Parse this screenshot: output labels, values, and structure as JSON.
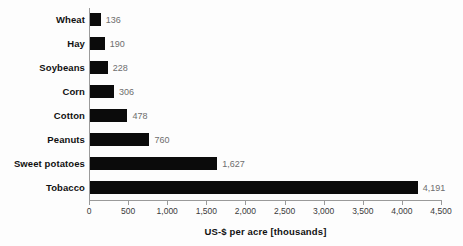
{
  "chart_data": {
    "type": "bar",
    "orientation": "horizontal",
    "title": "",
    "subtitle": "",
    "xlabel": "US-$ per acre [thousands]",
    "ylabel": "",
    "categories": [
      "Wheat",
      "Hay",
      "Soybeans",
      "Corn",
      "Cotton",
      "Peanuts",
      "Sweet potatoes",
      "Tobacco"
    ],
    "values": [
      136,
      190,
      228,
      306,
      478,
      760,
      1627,
      4191
    ],
    "value_labels": [
      "136",
      "190",
      "228",
      "306",
      "478",
      "760",
      "1,627",
      "4,191"
    ],
    "xlim": [
      0,
      4500
    ],
    "xticks": [
      0,
      500,
      1000,
      1500,
      2000,
      2500,
      3000,
      3500,
      4000,
      4500
    ],
    "xtick_labels": [
      "0",
      "500",
      "1,000",
      "1,500",
      "2,000",
      "2,500",
      "3,000",
      "3,500",
      "4,000",
      "4,500"
    ],
    "grid": false,
    "legend": null,
    "legend_position": "none",
    "annotations": [],
    "colors": {
      "bar": "#0b0b0b",
      "axis": "#9a9a9a",
      "category_label": "#111111",
      "value_label": "#6e6e6e",
      "tick_label": "#3a3a3a",
      "background": "#fdfdfd"
    }
  },
  "axis": {
    "title": "US-$ per acre [thousands]"
  },
  "rows": [
    {
      "label": "Wheat",
      "value": 136,
      "value_label": "136"
    },
    {
      "label": "Hay",
      "value": 190,
      "value_label": "190"
    },
    {
      "label": "Soybeans",
      "value": 228,
      "value_label": "228"
    },
    {
      "label": "Corn",
      "value": 306,
      "value_label": "306"
    },
    {
      "label": "Cotton",
      "value": 478,
      "value_label": "478"
    },
    {
      "label": "Peanuts",
      "value": 760,
      "value_label": "760"
    },
    {
      "label": "Sweet potatoes",
      "value": 1627,
      "value_label": "1,627"
    },
    {
      "label": "Tobacco",
      "value": 4191,
      "value_label": "4,191"
    }
  ],
  "ticks": [
    {
      "value": 0,
      "label": "0"
    },
    {
      "value": 500,
      "label": "500"
    },
    {
      "value": 1000,
      "label": "1,000"
    },
    {
      "value": 1500,
      "label": "1,500"
    },
    {
      "value": 2000,
      "label": "2,000"
    },
    {
      "value": 2500,
      "label": "2,500"
    },
    {
      "value": 3000,
      "label": "3,000"
    },
    {
      "value": 3500,
      "label": "3,500"
    },
    {
      "value": 4000,
      "label": "4,000"
    },
    {
      "value": 4500,
      "label": "4,500"
    }
  ]
}
